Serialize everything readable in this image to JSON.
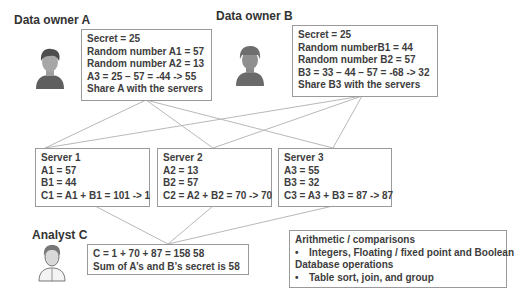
{
  "owner_a": {
    "label": "Data owner A",
    "lines": [
      "Secret = 25",
      "Random number A1 = 57",
      "Random number A2 = 13",
      "A3 = 25 – 57 = -44 -> 55",
      "Share A with the servers"
    ]
  },
  "owner_b": {
    "label": "Data owner B",
    "lines": [
      "Secret = 25",
      "Random numberB1 = 44",
      "Random number B2 = 57",
      "B3 = 33 – 44 – 57 = -68 -> 32",
      "Share B3 with the servers"
    ]
  },
  "servers": [
    {
      "title": "Server 1",
      "lines": [
        "A1 = 57",
        "B1 = 44",
        "C1 = A1 + B1 = 101 -> 1"
      ]
    },
    {
      "title": "Server 2",
      "lines": [
        "A2 = 13",
        "B2 = 57",
        "C2 = A2 + B2 = 70 -> 70"
      ]
    },
    {
      "title": "Server 3",
      "lines": [
        "A3 = 55",
        "B3 = 32",
        "C3 = A3 + B3 = 87 -> 87"
      ]
    }
  ],
  "analyst": {
    "label": "Analyst C",
    "lines": [
      "C = 1 + 70 + 87 = 158   58",
      "Sum of A’s and B’s secret is 58"
    ]
  },
  "operations": {
    "heading_1": "Arithmetic / comparisons",
    "bullet_1": "Integers, Floating / fixed point and Boolean",
    "heading_2": "Database operations",
    "bullet_2": "Table sort,  join, and group",
    "bullet_symbol": "•"
  },
  "icons": {
    "owner_a": "person-icon",
    "owner_b": "person-with-cap-icon",
    "analyst": "person-icon"
  },
  "colors": {
    "line": "#a8a8a8",
    "border": "#9a9a9a",
    "text": "#3d3d3d",
    "avatar_dark": "#5f5f5f",
    "avatar_face": "#9e9e9e"
  }
}
